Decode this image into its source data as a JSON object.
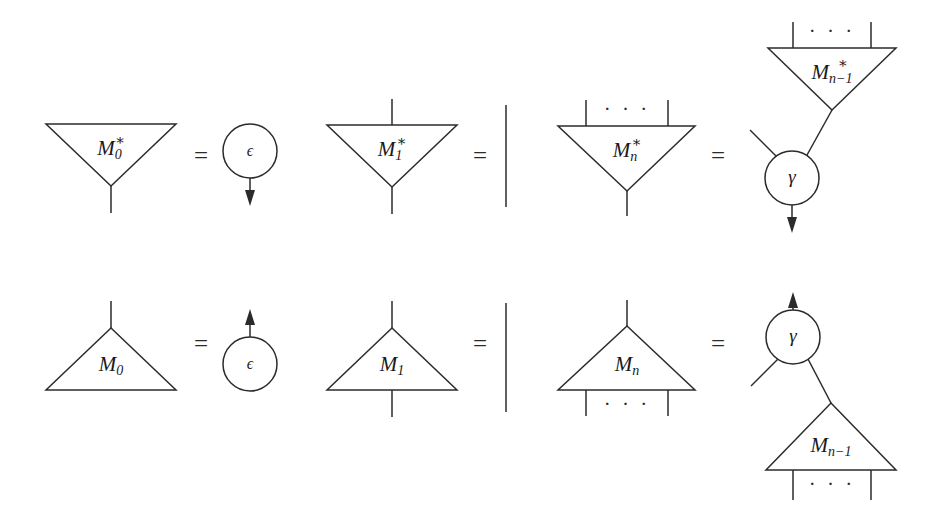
{
  "figure": {
    "background_color": "#ffffff",
    "line_color": "#2b2b2b",
    "text_color": "#1a1a1a",
    "width": 937,
    "height": 526
  },
  "symbols": {
    "equals": "=",
    "ellipsis": "· · ·",
    "epsilon": "ϵ",
    "gamma": "γ",
    "M": "M",
    "star": "∗",
    "sub_0": "0",
    "sub_1": "1",
    "sub_n": "n",
    "sub_n_minus_1": "n−1"
  },
  "rows": [
    {
      "name": "comultiplication-row",
      "equations": [
        {
          "name": "equation-m0-star",
          "lhs_label": "M",
          "lhs_sub": "0",
          "lhs_star": "∗",
          "relation": "=",
          "rhs_node": "ϵ",
          "rhs_direction": "down"
        },
        {
          "name": "equation-m1-star",
          "lhs_label": "M",
          "lhs_sub": "1",
          "lhs_star": "∗",
          "relation": "=",
          "rhs_node": "identity-wire",
          "rhs_direction": "none"
        },
        {
          "name": "equation-mn-star",
          "lhs_label": "M",
          "lhs_sub": "n",
          "lhs_star": "∗",
          "relation": "=",
          "rhs_label": "M",
          "rhs_sub": "n−1",
          "rhs_star": "∗",
          "rhs_node": "γ",
          "rhs_direction": "down"
        }
      ]
    },
    {
      "name": "multiplication-row",
      "equations": [
        {
          "name": "equation-m0",
          "lhs_label": "M",
          "lhs_sub": "0",
          "lhs_star": "",
          "relation": "=",
          "rhs_node": "ϵ",
          "rhs_direction": "up"
        },
        {
          "name": "equation-m1",
          "lhs_label": "M",
          "lhs_sub": "1",
          "lhs_star": "",
          "relation": "=",
          "rhs_node": "identity-wire",
          "rhs_direction": "none"
        },
        {
          "name": "equation-mn",
          "lhs_label": "M",
          "lhs_sub": "n",
          "lhs_star": "",
          "relation": "=",
          "rhs_label": "M",
          "rhs_sub": "n−1",
          "rhs_star": "",
          "rhs_node": "γ",
          "rhs_direction": "up"
        }
      ]
    }
  ]
}
